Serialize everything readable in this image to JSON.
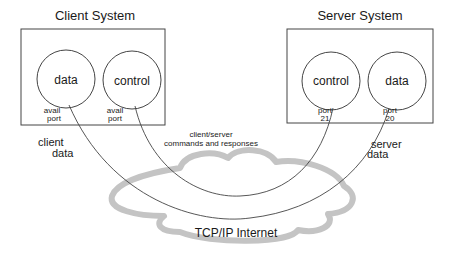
{
  "client": {
    "title": "Client System",
    "data_circle": "data",
    "control_circle": "control",
    "data_port_line1": "avail",
    "data_port_line2": "port",
    "control_port_line1": "avail",
    "control_port_line2": "port",
    "flow_line1": "client",
    "flow_line2": "data"
  },
  "server": {
    "title": "Server System",
    "control_circle": "control",
    "data_circle": "data",
    "control_port_line1": "port",
    "control_port_line2": "21",
    "data_port_line1": "port",
    "data_port_line2": "20",
    "flow_line1": "server",
    "flow_line2": "data"
  },
  "connection": {
    "line1": "client/server",
    "line2": "commands and responses"
  },
  "network": {
    "label": "TCP/IP Internet",
    "cloud_color": "#c8c8c8"
  }
}
